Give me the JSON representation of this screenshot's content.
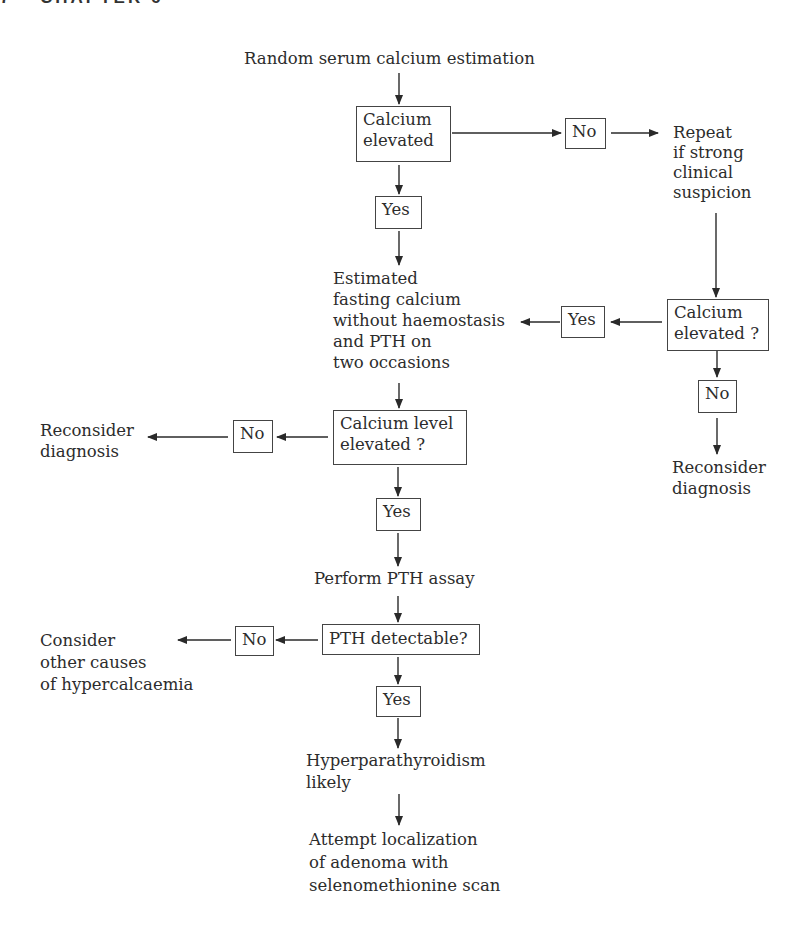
{
  "header": {
    "page_number": "7",
    "chapter": "CHAPTER 6"
  },
  "flowchart": {
    "start": "Random serum calcium estimation",
    "q1": {
      "line1": "Calcium",
      "line2": "elevated"
    },
    "q1_no": "No",
    "repeat": {
      "line1": "Repeat",
      "line2": "if strong",
      "line3": "clinical",
      "line4": "suspicion"
    },
    "q1_yes": "Yes",
    "fasting": {
      "line1": "Estimated",
      "line2": "fasting calcium",
      "line3": "without haemostasis",
      "line4": "and PTH on",
      "line5": "two occasions"
    },
    "q2": {
      "line1": "Calcium",
      "line2": "elevated ?"
    },
    "q2_yes": "Yes",
    "q2_no": "No",
    "reconsider_right": {
      "line1": "Reconsider",
      "line2": "diagnosis"
    },
    "q3": {
      "line1": "Calcium level",
      "line2": "elevated ?"
    },
    "q3_no": "No",
    "reconsider_left": {
      "line1": "Reconsider",
      "line2": "diagnosis"
    },
    "q3_yes": "Yes",
    "assay": "Perform PTH assay",
    "q4": "PTH detectable?",
    "q4_no": "No",
    "other_causes": {
      "line1": "Consider",
      "line2": "other causes",
      "line3": "of hypercalcaemia"
    },
    "q4_yes": "Yes",
    "hyper": {
      "line1": "Hyperparathyroidism",
      "line2": "likely"
    },
    "localize": {
      "line1": "Attempt localization",
      "line2": "of adenoma with",
      "line3": "selenomethionine scan"
    }
  }
}
